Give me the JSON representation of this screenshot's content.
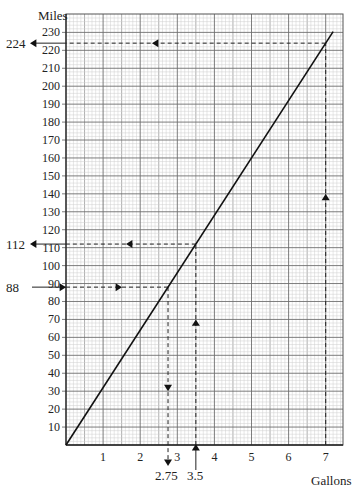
{
  "chart_data": {
    "type": "line",
    "title": "",
    "xlabel": "Gallons",
    "ylabel": "Miles",
    "xlim": [
      0,
      7.4
    ],
    "ylim": [
      0,
      235
    ],
    "x_ticks": [
      1,
      2,
      3,
      4,
      5,
      6,
      7
    ],
    "y_ticks": [
      10,
      20,
      30,
      40,
      50,
      60,
      70,
      80,
      90,
      100,
      110,
      120,
      130,
      140,
      150,
      160,
      170,
      180,
      190,
      200,
      210,
      220,
      230
    ],
    "grid": true,
    "minor_grid": true,
    "series": [
      {
        "name": "Miles vs Gallons",
        "x": [
          0,
          7.2
        ],
        "y": [
          0,
          230.4
        ],
        "slope_mpg": 32
      }
    ],
    "annotations": [
      {
        "type": "reading",
        "from_axis": "x",
        "x": 7,
        "y": 224,
        "x_label": "",
        "y_label": "224",
        "direction": "x-to-y"
      },
      {
        "type": "reading",
        "from_axis": "x",
        "x": 3.5,
        "y": 112,
        "x_label": "3.5",
        "y_label": "112",
        "direction": "x-to-y"
      },
      {
        "type": "reading",
        "from_axis": "y",
        "x": 2.75,
        "y": 88,
        "x_label": "2.75",
        "y_label": "88",
        "direction": "y-to-x"
      }
    ]
  },
  "labels": {
    "y_axis_title": "Miles",
    "x_axis_title": "Gallons",
    "reading_224": "224",
    "reading_112": "112",
    "reading_88": "88",
    "reading_275": "2.75",
    "reading_35": "3.5"
  }
}
